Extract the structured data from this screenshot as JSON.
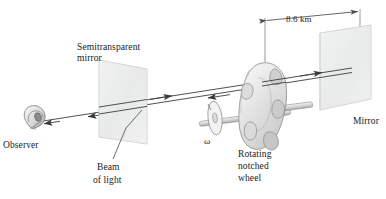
{
  "figure": {
    "background_color": "#ffffff",
    "line_color": "#3a3a3a",
    "glass_fill": "#e9ebe9",
    "wheel_fill": "#e3e3e3"
  },
  "labels": {
    "semitransparent_mirror_line1": "Semitransparent",
    "semitransparent_mirror_line2": "mirror",
    "observer": "Observer",
    "beam_line1": "Beam",
    "beam_line2": "of light",
    "rotating_line1": "Rotating",
    "rotating_line2": "notched",
    "rotating_line3": "wheel",
    "mirror": "Mirror",
    "omega": "ω",
    "distance": "8.6 km"
  },
  "icons": {
    "eye": "eye-icon",
    "beam_arrow_left": "arrow-left-icon",
    "beam_arrow_right": "arrow-right-icon",
    "dimension_arrow": "dimension-arrow-icon"
  },
  "measurements": {
    "baseline_distance_value": 8.6,
    "baseline_distance_unit": "km"
  }
}
